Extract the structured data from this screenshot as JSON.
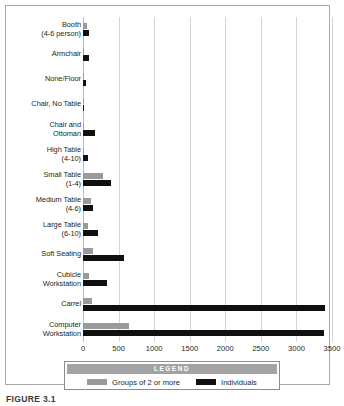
{
  "figure": {
    "caption": "FIGURE 3.1"
  },
  "legend": {
    "title": "LEGEND",
    "entries": [
      {
        "label": "Groups of 2 or more",
        "color": "#9a9a9a",
        "key": "groups"
      },
      {
        "label": "Individuals",
        "color": "#101010",
        "key": "individuals"
      }
    ]
  },
  "colors": {
    "groups": "#9a9a9a",
    "individuals": "#101010",
    "gridline": "#d6d6d6",
    "frame": "#a8a8a8",
    "text": "#231f20"
  },
  "chart_data": {
    "type": "bar",
    "orientation": "horizontal",
    "title": "",
    "xlabel": "",
    "ylabel": "",
    "xlim": [
      0,
      3500
    ],
    "xticks": [
      0,
      500,
      1000,
      1500,
      2000,
      2500,
      3000,
      3500
    ],
    "xtick_labels": [
      "0",
      "500",
      "1000",
      "1500",
      "2000",
      "2500",
      "3000",
      "3500"
    ],
    "grid": true,
    "legend_position": "bottom",
    "categories": [
      "Booth\n(4-6 person)",
      "Armchair",
      "None/Floor",
      "Chair, No Table",
      "Chair and\nOttoman",
      "High Table\n(4-10)",
      "Small Table\n(1-4)",
      "Medium Table\n(4-6)",
      "Large Table\n(6-10)",
      "Soft Seating",
      "Cubicle\nWorkstation",
      "Carrel",
      "Computer\nWorkstation"
    ],
    "series": [
      {
        "name": "Groups of 2 or more",
        "color": "#9a9a9a",
        "values": [
          60,
          10,
          8,
          5,
          15,
          20,
          280,
          110,
          75,
          140,
          90,
          130,
          640
        ]
      },
      {
        "name": "Individuals",
        "color": "#101010",
        "values": [
          90,
          85,
          45,
          5,
          170,
          70,
          390,
          140,
          215,
          575,
          335,
          3400,
          3390
        ]
      }
    ]
  }
}
